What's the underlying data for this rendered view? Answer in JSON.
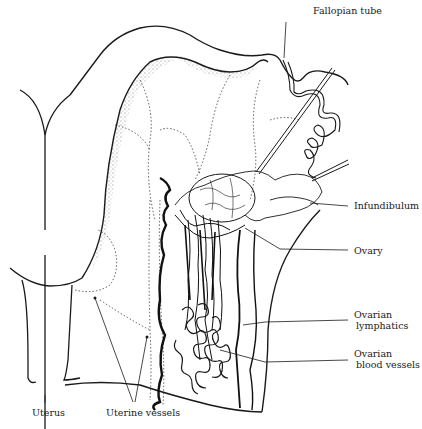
{
  "figure": {
    "labels": {
      "fallopian_tube": "Fallopian tube",
      "infundibulum": "Infundibulum",
      "ovary": "Ovary",
      "ovarian_lymphatics_1": "Ovarian",
      "ovarian_lymphatics_2": "lymphatics",
      "ovarian_blood_vessels_1": "Ovarian",
      "ovarian_blood_vessels_2": "blood vessels",
      "uterus": "Uterus",
      "uterine_vessels": "Uterine vessels"
    },
    "colors": {
      "ink": "#1a1a1a",
      "background": "#ffffff"
    }
  }
}
